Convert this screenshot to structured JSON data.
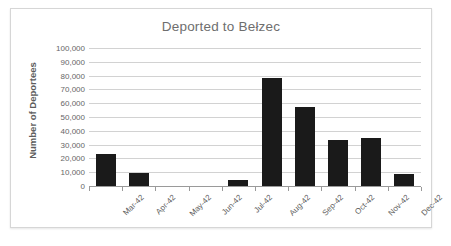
{
  "chart_data": {
    "type": "bar",
    "title": "Deported to Bełzec",
    "xlabel": "",
    "ylabel": "Number of Deportees",
    "ylim": [
      0,
      100000
    ],
    "ytick_step": 10000,
    "grid": true,
    "legend": "none",
    "bar_color": "#1a1a1a",
    "categories": [
      "Mar-42",
      "Apr-42",
      "May-42",
      "Jun-42",
      "Jul-42",
      "Aug-42",
      "Sep-42",
      "Oct-42",
      "Nov-42",
      "Dec-42"
    ],
    "values": [
      23000,
      9500,
      0,
      0,
      4000,
      78000,
      57000,
      33000,
      35000,
      9000
    ],
    "ytick_labels": [
      "100,000",
      "90,000",
      "80,000",
      "70,000",
      "60,000",
      "50,000",
      "40,000",
      "30,000",
      "20,000",
      "10,000",
      "0"
    ]
  }
}
